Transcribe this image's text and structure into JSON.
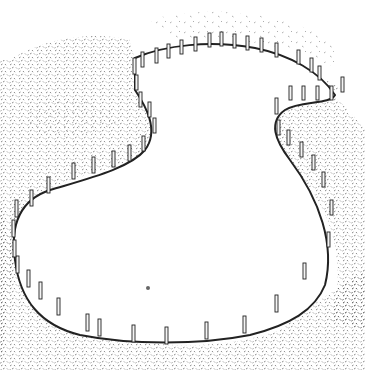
{
  "image": {
    "description": "Pen-and-ink illustration of a curved, kidney/figure-eight shaped garden bed outlined by edging strip held with wooden stakes, surrounded by stippled ground cover",
    "style": "black and white line drawing with stipple texture",
    "colors": {
      "background": "#ffffff",
      "ink": "#222222",
      "stipple": "#555555",
      "post_fill": "#f4f4f4"
    },
    "stake_count": 62
  }
}
